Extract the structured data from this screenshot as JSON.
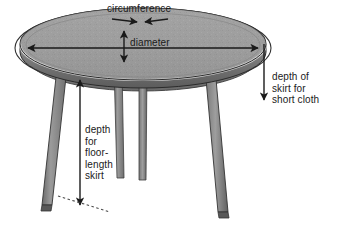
{
  "diagram": {
    "labels": {
      "circumference": "circumference",
      "diameter": "diameter",
      "depth_short_cloth": "depth of\nskirt for\nshort cloth",
      "depth_floor_skirt": "depth\nfor\nfloor-\nlength\nskirt"
    },
    "colors": {
      "background": "#ffffff",
      "ink": "#1a1a1a",
      "table_top_fill": "#9e9e9e",
      "table_top_highlight": "#c9c9c9",
      "table_edge_dark": "#6b6b6b",
      "table_edge_mid": "#808080",
      "apron_fill": "#7a7a7a",
      "leg_light": "#9a9a9a",
      "leg_mid": "#7d7d7d",
      "leg_dark": "#5f5f5f",
      "outline": "#262626",
      "cloth_outline": "#3a3a3a"
    },
    "measures": [
      {
        "name": "circumference",
        "annotation": "two arrowheads meeting at top of cloth ellipse"
      },
      {
        "name": "diameter",
        "annotation": "horizontal double-headed arrow across table top"
      },
      {
        "name": "table-top-thickness",
        "annotation": "vertical double-headed arrow on table top"
      },
      {
        "name": "depth of skirt for short cloth",
        "annotation": "downward arrow at right from cloth edge"
      },
      {
        "name": "depth for floor-length skirt",
        "annotation": "vertical double-headed arrow from apron to floor"
      }
    ],
    "icons": {
      "floor_line": "dashed-floor-line",
      "arrow_down": "arrow-down-icon",
      "arrow_double": "double-arrow-icon"
    }
  }
}
